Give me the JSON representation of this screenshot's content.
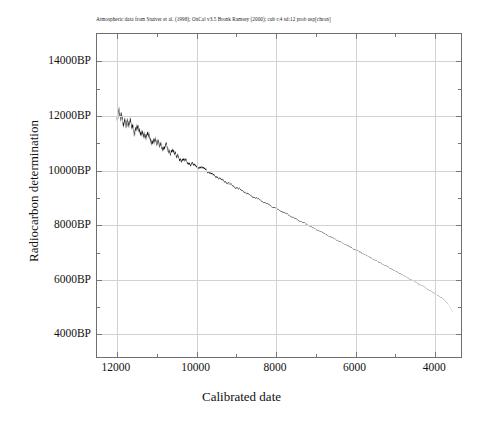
{
  "chart_data": {
    "type": "line",
    "title": "Atmospheric data from Stuiver et al. (1998); OxCal v3.5 Bronk Ramsey (2000); cub r:4 sd:12 prob usp[chron]",
    "xlabel": "Calibrated date",
    "ylabel": "Radiocarbon determination",
    "xlim": [
      12500,
      3300
    ],
    "ylim": [
      3100,
      15000
    ],
    "x_axis_reversed": true,
    "grid": true,
    "legend": "none",
    "x_tick_labels": [
      "12000",
      "10000",
      "8000",
      "6000",
      "4000"
    ],
    "x_tick_values": [
      12000,
      10000,
      8000,
      6000,
      4000
    ],
    "x_minor_tick_values": [
      11000,
      9000,
      7000,
      5000
    ],
    "y_tick_labels": [
      "14000BP",
      "12000BP",
      "10000BP",
      "8000BP",
      "6000BP",
      "4000BP"
    ],
    "y_tick_values": [
      14000,
      12000,
      10000,
      8000,
      6000,
      4000
    ],
    "y_minor_tick_values": [
      13000,
      11000,
      9000,
      7000,
      5000
    ],
    "series": [
      {
        "name": "calibration curve",
        "color": "#000000",
        "x": [
          12000,
          11950,
          11900,
          11850,
          11800,
          11750,
          11700,
          11650,
          11600,
          11550,
          11500,
          11450,
          11400,
          11350,
          11300,
          11250,
          11200,
          11150,
          11100,
          11050,
          11000,
          10950,
          10900,
          10850,
          10800,
          10750,
          10700,
          10650,
          10600,
          10550,
          10500,
          10400,
          10300,
          10200,
          10100,
          10000,
          9900,
          9800,
          9700,
          9600,
          9500,
          9400,
          9300,
          9200,
          9100,
          9000,
          8900,
          8800,
          8700,
          8600,
          8500,
          8400,
          8300,
          8200,
          8100,
          8000,
          7900,
          7800,
          7700,
          7600,
          7500,
          7400,
          7300,
          7200,
          7100,
          7000,
          6900,
          6800,
          6700,
          6600,
          6500,
          6400,
          6300,
          6200,
          6100,
          6000,
          5900,
          5800,
          5700,
          5600,
          5500,
          5400,
          5300,
          5200,
          5100,
          5000,
          4900,
          4800,
          4700,
          4600,
          4500,
          4400,
          4300,
          4200,
          4100,
          4000,
          3900,
          3800,
          3700,
          3600,
          3500
        ],
        "y": [
          11900,
          12050,
          11850,
          11780,
          11870,
          11700,
          11620,
          11700,
          11560,
          11480,
          11540,
          11400,
          11330,
          11420,
          11280,
          11200,
          11270,
          11130,
          11050,
          11120,
          10990,
          10920,
          10990,
          10860,
          10790,
          10850,
          10720,
          10660,
          10730,
          10600,
          10540,
          10420,
          10330,
          10270,
          10200,
          10120,
          10080,
          10060,
          9940,
          9830,
          9740,
          9680,
          9600,
          9520,
          9430,
          9350,
          9280,
          9200,
          9120,
          9040,
          8970,
          8900,
          8820,
          8740,
          8660,
          8590,
          8520,
          8440,
          8370,
          8290,
          8210,
          8130,
          8060,
          7990,
          7910,
          7840,
          7760,
          7680,
          7610,
          7530,
          7460,
          7380,
          7300,
          7230,
          7150,
          7070,
          7000,
          6920,
          6850,
          6770,
          6690,
          6610,
          6540,
          6460,
          6380,
          6300,
          6220,
          6140,
          6060,
          5980,
          5900,
          5820,
          5740,
          5650,
          5560,
          5470,
          5380,
          5290,
          5180,
          5000,
          4720
        ],
        "envelope_width_bp": [
          320,
          330,
          330,
          320,
          310,
          300,
          300,
          290,
          290,
          280,
          280,
          270,
          270,
          260,
          260,
          250,
          250,
          240,
          240,
          235,
          230,
          225,
          220,
          215,
          210,
          205,
          200,
          195,
          190,
          185,
          180,
          160,
          145,
          130,
          120,
          110,
          100,
          95,
          90,
          85,
          80,
          76,
          72,
          68,
          65,
          62,
          60,
          58,
          56,
          54,
          52,
          50,
          49,
          48,
          47,
          46,
          45,
          44,
          43,
          42,
          41,
          40,
          39,
          38,
          37,
          36,
          35,
          34,
          34,
          33,
          33,
          32,
          32,
          31,
          31,
          30,
          30,
          29,
          29,
          28,
          28,
          27,
          27,
          26,
          26,
          25,
          25,
          24,
          24,
          23,
          23,
          22,
          22,
          21,
          21,
          20,
          20,
          19,
          19,
          18,
          18
        ]
      }
    ]
  }
}
